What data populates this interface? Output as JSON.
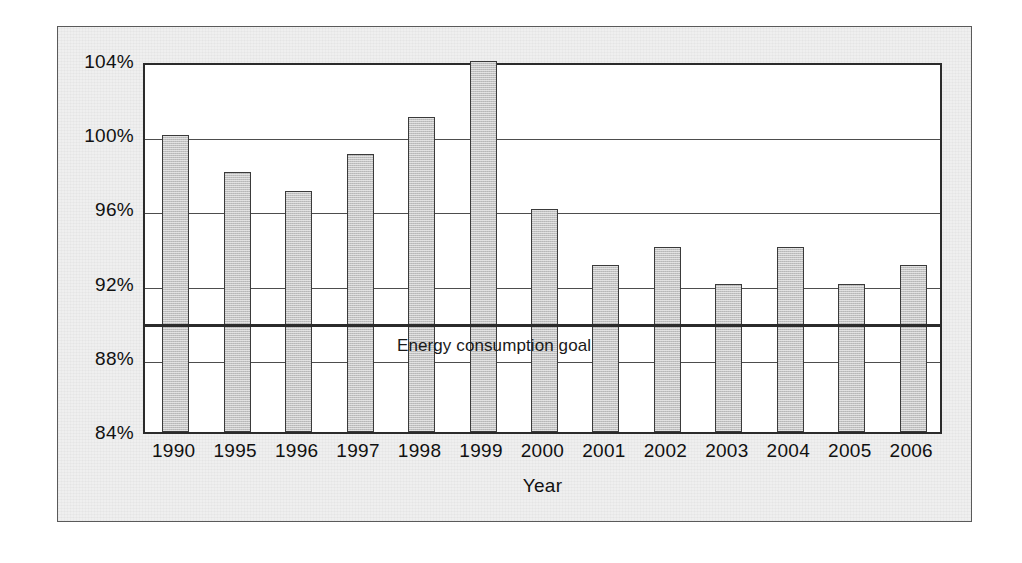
{
  "chart_data": {
    "type": "bar",
    "title": "",
    "xlabel": "Year",
    "ylabel": "",
    "categories": [
      "1990",
      "1995",
      "1996",
      "1997",
      "1998",
      "1999",
      "2000",
      "2001",
      "2002",
      "2003",
      "2004",
      "2005",
      "2006"
    ],
    "values": [
      100,
      98,
      97,
      99,
      101,
      104,
      96,
      93,
      94,
      92,
      94,
      92,
      93
    ],
    "value_unit": "%",
    "ylim": [
      84,
      104
    ],
    "yticks": [
      84,
      88,
      92,
      96,
      100,
      104
    ],
    "ytick_labels": [
      "84%",
      "88%",
      "92%",
      "96%",
      "100%",
      "104%"
    ],
    "grid": true,
    "legend": false,
    "annotations": [
      {
        "name": "energy-consumption-goal",
        "label": "Energy consumption goal",
        "type": "horizontal-line",
        "value": 90
      }
    ],
    "series": [
      {
        "name": "Energy consumption",
        "color": "#c2c2c2",
        "values": [
          100,
          98,
          97,
          99,
          101,
          104,
          96,
          93,
          94,
          92,
          94,
          92,
          93
        ]
      }
    ]
  },
  "colors": {
    "bar_fill": "#c2c2c2",
    "bar_edge": "#3a3a3a",
    "grid": "#4d4d4d",
    "goal_line": "#2b2b2b",
    "panel_background": "#efefef",
    "plot_background": "#ffffff",
    "text": "#111111"
  }
}
